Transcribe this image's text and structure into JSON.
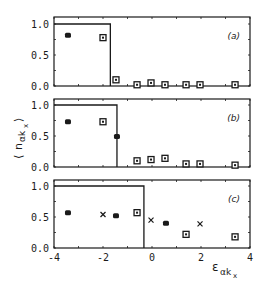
{
  "chart_data": [
    {
      "type": "scatter",
      "panel_label": "(a)",
      "xlim": [
        -4,
        4
      ],
      "ylim": [
        0.0,
        1.0
      ],
      "yticks": [
        "1.0",
        "0.5",
        "0.0"
      ],
      "step_function": {
        "value": 1.0,
        "x_edge": -1.7
      },
      "series": [
        {
          "marker": "filled",
          "points": [
            [
              -3.43,
              0.82
            ]
          ]
        },
        {
          "marker": "square-dot",
          "points": [
            [
              -2.0,
              0.78
            ],
            [
              -1.47,
              0.1
            ],
            [
              -0.61,
              0.02
            ],
            [
              -0.04,
              0.05
            ],
            [
              0.53,
              0.02
            ],
            [
              1.39,
              0.02
            ],
            [
              1.96,
              0.02
            ],
            [
              3.39,
              0.02
            ]
          ]
        }
      ]
    },
    {
      "type": "scatter",
      "panel_label": "(b)",
      "xlim": [
        -4,
        4
      ],
      "ylim": [
        0.0,
        1.0
      ],
      "yticks": [
        "1.0",
        "0.5",
        "0.0"
      ],
      "step_function": {
        "value": 1.0,
        "x_edge": -1.43
      },
      "series": [
        {
          "marker": "filled",
          "points": [
            [
              -3.43,
              0.73
            ],
            [
              -1.43,
              0.49
            ]
          ]
        },
        {
          "marker": "square-dot",
          "points": [
            [
              -2.0,
              0.73
            ],
            [
              -0.61,
              0.1
            ],
            [
              -0.04,
              0.12
            ],
            [
              0.53,
              0.14
            ],
            [
              1.39,
              0.05
            ],
            [
              1.96,
              0.05
            ],
            [
              3.39,
              0.03
            ]
          ]
        }
      ]
    },
    {
      "type": "scatter",
      "panel_label": "(c)",
      "xlim": [
        -4,
        4
      ],
      "ylim": [
        0.0,
        1.0
      ],
      "yticks": [
        "1.0",
        "0.5",
        "0.0"
      ],
      "xticks": [
        "-4",
        "-2",
        "0",
        "2",
        "4"
      ],
      "step_function": {
        "value": 1.0,
        "x_edge": -0.33
      },
      "series": [
        {
          "marker": "filled",
          "points": [
            [
              -3.43,
              0.57
            ],
            [
              -1.47,
              0.52
            ],
            [
              0.57,
              0.4
            ]
          ]
        },
        {
          "marker": "cross",
          "points": [
            [
              -2.0,
              0.54
            ],
            [
              -0.04,
              0.45
            ],
            [
              1.96,
              0.39
            ]
          ]
        },
        {
          "marker": "square-dot",
          "points": [
            [
              -0.61,
              0.57
            ],
            [
              1.39,
              0.22
            ],
            [
              3.39,
              0.18
            ]
          ]
        }
      ]
    }
  ],
  "labels": {
    "ylabel_main": "n",
    "ylabel_sub": "αk",
    "ylabel_subsub": "x",
    "xlabel_main": "ε",
    "xlabel_sub": "αk",
    "xlabel_subsub": "x"
  }
}
